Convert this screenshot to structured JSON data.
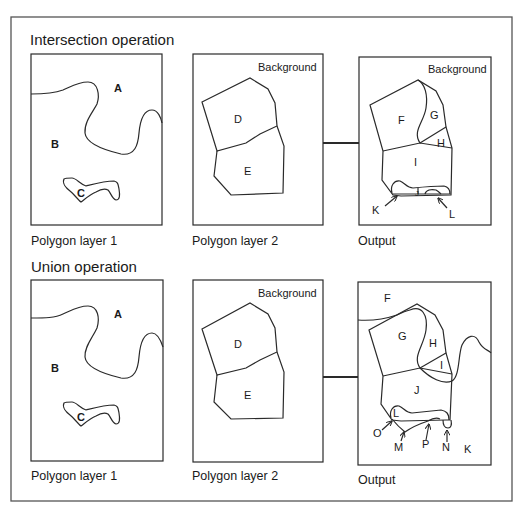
{
  "diagram": {
    "type": "GIS polygon overlay illustration",
    "colors": {
      "line": "#2a2a2a",
      "frame": "#555555",
      "background": "#ffffff",
      "text": "#1a1a1a"
    }
  },
  "intersection": {
    "title": "Intersection operation",
    "layer1": {
      "caption": "Polygon layer 1",
      "regions": {
        "a": "A",
        "b": "B",
        "c": "C"
      }
    },
    "layer2": {
      "caption": "Polygon layer 2",
      "background_label": "Background",
      "regions": {
        "d": "D",
        "e": "E"
      }
    },
    "output": {
      "caption": "Output",
      "background_label": "Background",
      "regions": {
        "f": "F",
        "g": "G",
        "h": "H",
        "i": "I",
        "j": "J",
        "k": "K",
        "l": "L"
      }
    }
  },
  "union": {
    "title": "Union operation",
    "layer1": {
      "caption": "Polygon layer 1",
      "regions": {
        "a": "A",
        "b": "B",
        "c": "C"
      }
    },
    "layer2": {
      "caption": "Polygon layer 2",
      "background_label": "Background",
      "regions": {
        "d": "D",
        "e": "E"
      }
    },
    "output": {
      "caption": "Output",
      "regions": {
        "f": "F",
        "g": "G",
        "h": "H",
        "i": "I",
        "j": "J",
        "k": "K",
        "l": "L",
        "m": "M",
        "n": "N",
        "o": "O",
        "p": "P"
      }
    }
  }
}
